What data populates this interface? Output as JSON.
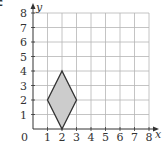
{
  "figure": {
    "corner_label": "c",
    "x_axis_label": "x",
    "y_axis_label": "y",
    "origin_label": "0"
  },
  "chart_data": {
    "type": "diagram",
    "title": "",
    "xlabel": "x",
    "ylabel": "y",
    "xlim": [
      0,
      8
    ],
    "ylim": [
      0,
      8
    ],
    "grid": true,
    "x_ticks": [
      "1",
      "2",
      "3",
      "4",
      "5",
      "6",
      "7",
      "8"
    ],
    "y_ticks": [
      "1",
      "2",
      "3",
      "4",
      "5",
      "6",
      "7",
      "8"
    ],
    "shapes": [
      {
        "name": "rhombus",
        "fill": "#cccccc",
        "stroke": "#333333",
        "vertices": [
          [
            2,
            0
          ],
          [
            3,
            2
          ],
          [
            2,
            4
          ],
          [
            1,
            2
          ]
        ]
      }
    ]
  }
}
